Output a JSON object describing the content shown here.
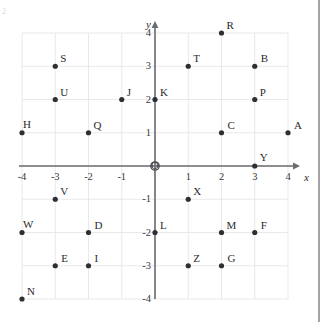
{
  "figure": {
    "name": "coordinate-plane",
    "caption": "",
    "background_color": "#ffffff"
  },
  "chart_data": {
    "type": "scatter",
    "title": "",
    "xlabel": "x",
    "ylabel": "y",
    "xlim": [
      -4,
      4
    ],
    "ylim": [
      -4,
      4
    ],
    "grid": true,
    "legend": "none",
    "xticks": [
      "-4",
      "-3",
      "-2",
      "-1",
      "1",
      "2",
      "3",
      "4"
    ],
    "xtick_values": [
      -4,
      -3,
      -2,
      -1,
      1,
      2,
      3,
      4
    ],
    "yticks": [
      "4",
      "3",
      "2",
      "1",
      "-1",
      "-2",
      "-3",
      "-4"
    ],
    "ytick_values": [
      4,
      3,
      2,
      1,
      -1,
      -2,
      -3,
      -4
    ],
    "origin_label": "O",
    "point_color": "#2e2e33",
    "grid_color": "#e3e3e6",
    "axis_color": "#6b6b70",
    "points": [
      {
        "label": "A",
        "x": 4,
        "y": 1,
        "label_dx": 6,
        "label_dy": -13
      },
      {
        "label": "B",
        "x": 3,
        "y": 3,
        "label_dx": 6,
        "label_dy": -13
      },
      {
        "label": "C",
        "x": 2,
        "y": 1,
        "label_dx": 6,
        "label_dy": -13
      },
      {
        "label": "D",
        "x": -2,
        "y": -2,
        "label_dx": 6,
        "label_dy": -13
      },
      {
        "label": "E",
        "x": -3,
        "y": -3,
        "label_dx": 6,
        "label_dy": -13
      },
      {
        "label": "F",
        "x": 3,
        "y": -2,
        "label_dx": 6,
        "label_dy": -13
      },
      {
        "label": "G",
        "x": 2,
        "y": -3,
        "label_dx": 6,
        "label_dy": -13
      },
      {
        "label": "H",
        "x": -4,
        "y": 1,
        "label_dx": 1,
        "label_dy": -14
      },
      {
        "label": "I",
        "x": -2,
        "y": -3,
        "label_dx": 6,
        "label_dy": -13
      },
      {
        "label": "J",
        "x": -1,
        "y": 2,
        "label_dx": 5,
        "label_dy": -13
      },
      {
        "label": "K",
        "x": 0,
        "y": 2,
        "label_dx": 5,
        "label_dy": -13
      },
      {
        "label": "L",
        "x": 0,
        "y": -2,
        "label_dx": 5,
        "label_dy": -13
      },
      {
        "label": "M",
        "x": 2,
        "y": -2,
        "label_dx": 5,
        "label_dy": -13
      },
      {
        "label": "N",
        "x": -4,
        "y": -4,
        "label_dx": 5,
        "label_dy": -13
      },
      {
        "label": "P",
        "x": 3,
        "y": 2,
        "label_dx": 5,
        "label_dy": -13
      },
      {
        "label": "Q",
        "x": -2,
        "y": 1,
        "label_dx": 5,
        "label_dy": -13
      },
      {
        "label": "R",
        "x": 2,
        "y": 4,
        "label_dx": 5,
        "label_dy": -13
      },
      {
        "label": "S",
        "x": -3,
        "y": 3,
        "label_dx": 5,
        "label_dy": -13
      },
      {
        "label": "T",
        "x": 1,
        "y": 3,
        "label_dx": 5,
        "label_dy": -13
      },
      {
        "label": "U",
        "x": -3,
        "y": 2,
        "label_dx": 5,
        "label_dy": -13
      },
      {
        "label": "V",
        "x": -3,
        "y": -1,
        "label_dx": 5,
        "label_dy": -13
      },
      {
        "label": "W",
        "x": -4,
        "y": -2,
        "label_dx": 1,
        "label_dy": -14
      },
      {
        "label": "X",
        "x": 1,
        "y": -1,
        "label_dx": 5,
        "label_dy": -13
      },
      {
        "label": "Y",
        "x": 3,
        "y": 0,
        "label_dx": 5,
        "label_dy": -14
      },
      {
        "label": "Z",
        "x": 1,
        "y": -3,
        "label_dx": 5,
        "label_dy": -13
      }
    ]
  },
  "geometry": {
    "origin_px_x": 155,
    "origin_px_y": 166,
    "unit_px": 33.25,
    "grid_left": -4,
    "grid_right": 4,
    "grid_top": 4,
    "grid_bottom": -4,
    "axis_arrow_overshoot": 12,
    "point_radius": 2.6
  },
  "corner": {
    "mark": "2"
  }
}
